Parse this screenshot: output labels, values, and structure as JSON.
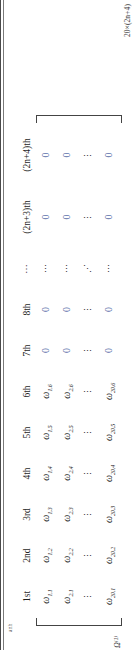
{
  "figure": {
    "type": "matrix",
    "dimension_label": "20×(2n+4)",
    "superscript_label": "Ω⁽¹⁾",
    "margin_note": "anh",
    "bracket_left": "[",
    "bracket_right": "]",
    "columns": [
      {
        "header": "1st",
        "width": "narrow"
      },
      {
        "header": "2nd",
        "width": "narrow"
      },
      {
        "header": "3rd",
        "width": "narrow"
      },
      {
        "header": "4th",
        "width": "narrow"
      },
      {
        "header": "5th",
        "width": "narrow"
      },
      {
        "header": "6th",
        "width": "narrow"
      },
      {
        "header": "7th",
        "width": "narrow"
      },
      {
        "header": "8th",
        "width": "narrow"
      },
      {
        "header": "⋯",
        "width": "narrow"
      },
      {
        "header": "(2n+3)th",
        "width": "wide"
      },
      {
        "header": "(2n+4)th",
        "width": "wide"
      }
    ],
    "rows": [
      {
        "name": "row-1",
        "cells": [
          {
            "kind": "omega",
            "base": "ω",
            "sub": "1,1"
          },
          {
            "kind": "omega",
            "base": "ω",
            "sub": "1,2"
          },
          {
            "kind": "omega",
            "base": "ω",
            "sub": "1,3"
          },
          {
            "kind": "omega",
            "base": "ω",
            "sub": "1,4"
          },
          {
            "kind": "omega",
            "base": "ω",
            "sub": "1,5"
          },
          {
            "kind": "omega",
            "base": "ω",
            "sub": "1,6"
          },
          {
            "kind": "zero",
            "text": "0"
          },
          {
            "kind": "zero",
            "text": "0"
          },
          {
            "kind": "dots",
            "text": "⋯"
          },
          {
            "kind": "zero",
            "text": "0"
          },
          {
            "kind": "zero",
            "text": "0"
          }
        ]
      },
      {
        "name": "row-2",
        "cells": [
          {
            "kind": "omega",
            "base": "ω",
            "sub": "2,1"
          },
          {
            "kind": "omega",
            "base": "ω",
            "sub": "2,2"
          },
          {
            "kind": "omega",
            "base": "ω",
            "sub": "2,3"
          },
          {
            "kind": "omega",
            "base": "ω",
            "sub": "2,4"
          },
          {
            "kind": "omega",
            "base": "ω",
            "sub": "2,5"
          },
          {
            "kind": "omega",
            "base": "ω",
            "sub": "2,6"
          },
          {
            "kind": "zero",
            "text": "0"
          },
          {
            "kind": "zero",
            "text": "0"
          },
          {
            "kind": "dots",
            "text": "⋯"
          },
          {
            "kind": "zero",
            "text": "0"
          },
          {
            "kind": "zero",
            "text": "0"
          }
        ]
      },
      {
        "name": "row-ellipsis",
        "cells": [
          {
            "kind": "vdots",
            "text": "⋮"
          },
          {
            "kind": "vdots",
            "text": "⋮"
          },
          {
            "kind": "vdots",
            "text": "⋮"
          },
          {
            "kind": "vdots",
            "text": "⋮"
          },
          {
            "kind": "vdots",
            "text": "⋮"
          },
          {
            "kind": "vdots",
            "text": "⋮"
          },
          {
            "kind": "vdots",
            "text": "⋮"
          },
          {
            "kind": "vdots",
            "text": "⋮"
          },
          {
            "kind": "ddots",
            "text": "⋰"
          },
          {
            "kind": "vdots",
            "text": "⋮"
          },
          {
            "kind": "vdots",
            "text": "⋮"
          }
        ]
      },
      {
        "name": "row-20",
        "cells": [
          {
            "kind": "omega",
            "base": "ω",
            "sub": "20,1"
          },
          {
            "kind": "omega",
            "base": "ω",
            "sub": "20,2"
          },
          {
            "kind": "omega",
            "base": "ω",
            "sub": "20,3"
          },
          {
            "kind": "omega",
            "base": "ω",
            "sub": "20,4"
          },
          {
            "kind": "omega",
            "base": "ω",
            "sub": "20,5"
          },
          {
            "kind": "omega",
            "base": "ω",
            "sub": "20,6"
          },
          {
            "kind": "zero",
            "text": "0"
          },
          {
            "kind": "zero",
            "text": "0"
          },
          {
            "kind": "dots",
            "text": "⋯"
          },
          {
            "kind": "zero",
            "text": "0"
          },
          {
            "kind": "zero",
            "text": "0"
          }
        ]
      }
    ],
    "colors": {
      "zero": "#5b6ea8",
      "text": "#1f1f1f",
      "rule": "#4a4a4a"
    }
  }
}
